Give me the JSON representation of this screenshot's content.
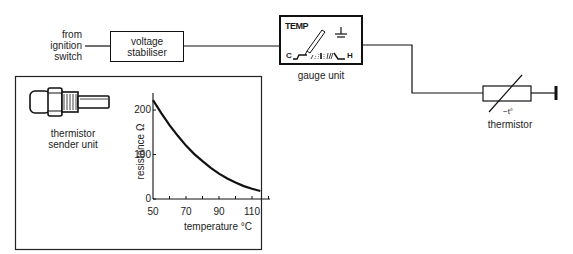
{
  "circuit": {
    "source_label": [
      "from",
      "ignition",
      "switch"
    ],
    "stabiliser_label": [
      "voltage",
      "stabiliser"
    ],
    "gauge": {
      "title": "TEMP",
      "cold_label": "C",
      "hot_label": "H",
      "caption": "gauge unit",
      "earth_symbol": "earth-icon"
    },
    "thermistor": {
      "symbol_label": "−t°",
      "caption": "thermistor"
    }
  },
  "inset": {
    "sender_caption": [
      "thermistor",
      "sender unit"
    ],
    "chart_data": {
      "type": "line",
      "title": "",
      "xlabel": "temperature °C",
      "ylabel": "resistance Ω",
      "x_ticks": [
        50,
        70,
        90,
        110
      ],
      "y_ticks": [
        0,
        100,
        200
      ],
      "xlim": [
        50,
        120
      ],
      "ylim": [
        0,
        240
      ],
      "grid": false,
      "series": [
        {
          "name": "thermistor resistance",
          "x": [
            50,
            55,
            60,
            65,
            70,
            75,
            80,
            85,
            90,
            95,
            100,
            105,
            110,
            115
          ],
          "values": [
            222,
            193,
            166,
            142,
            120,
            101,
            85,
            70,
            57,
            46,
            37,
            29,
            23,
            18
          ]
        }
      ]
    }
  }
}
